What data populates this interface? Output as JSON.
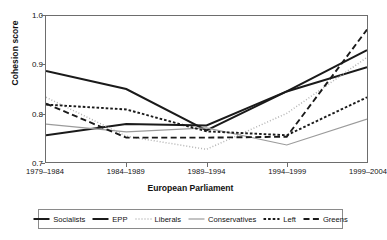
{
  "chart_data": {
    "type": "line",
    "title": "",
    "xlabel": "European Parliament",
    "ylabel": "Cohesion score",
    "categories": [
      "1979–1984",
      "1984–1989",
      "1989–1994",
      "1994–1999",
      "1999–2004"
    ],
    "ylim": [
      0.7,
      1.0
    ],
    "yticks": [
      "0.7",
      "0.8",
      "0.9",
      "1.0"
    ],
    "ytick_values": [
      0.7,
      0.8,
      0.9,
      1.0
    ],
    "grid": false,
    "legend_position": "bottom",
    "series": [
      {
        "name": "Socialists",
        "style": "solid",
        "color": "#1a1a1a",
        "width": 2.0,
        "values": [
          0.887,
          0.85,
          0.765,
          0.845,
          0.93
        ]
      },
      {
        "name": "EPP",
        "style": "solid",
        "color": "#1a1a1a",
        "width": 2.0,
        "values": [
          0.755,
          0.778,
          0.775,
          0.845,
          0.895
        ]
      },
      {
        "name": "Liberals",
        "style": "dotted",
        "color": "#b4b4b4",
        "width": 1.5,
        "values": [
          0.833,
          0.753,
          0.726,
          0.8,
          0.915
        ]
      },
      {
        "name": "Conservatives",
        "style": "solid",
        "color": "#9b9b9b",
        "width": 1.2,
        "values": [
          0.778,
          0.762,
          0.77,
          0.735,
          0.788
        ]
      },
      {
        "name": "Left",
        "style": "dashed-fine",
        "color": "#1a1a1a",
        "width": 1.9,
        "values": [
          0.818,
          0.808,
          0.763,
          0.755,
          0.833
        ]
      },
      {
        "name": "Greens",
        "style": "dashed-long",
        "color": "#1a1a1a",
        "width": 1.9,
        "values": [
          0.82,
          0.75,
          0.75,
          0.752,
          0.972
        ]
      }
    ]
  },
  "legend": {
    "items": [
      {
        "label": "Socialists"
      },
      {
        "label": "EPP"
      },
      {
        "label": "Liberals"
      },
      {
        "label": "Conservatives"
      },
      {
        "label": "Left"
      },
      {
        "label": "Greens"
      }
    ]
  }
}
